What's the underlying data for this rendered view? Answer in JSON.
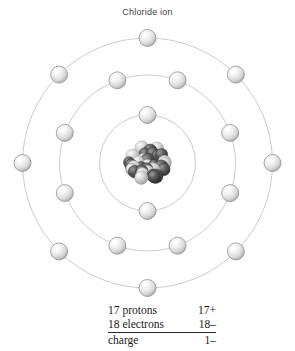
{
  "figure": {
    "title": "Chloride ion",
    "background_color": "#ffffff"
  },
  "atom": {
    "center": {
      "x": 147.5,
      "y": 141
    },
    "nucleus": {
      "name": "nucleus",
      "radius": 26,
      "light_color": "#c9c9c9",
      "dark_color": "#3f3f3f",
      "particle_count": 35
    },
    "shell_style": {
      "stroke_color": "#b4b4b4",
      "stroke_width": 0.7
    },
    "electron_style": {
      "radius": 8.5,
      "fill_color": "#e3e3e3",
      "highlight_color": "#ffffff",
      "edge_color": "#8e8e8e"
    },
    "shells": [
      {
        "name": "shell-1",
        "label": "K",
        "radius": 48,
        "electron_count": 2,
        "angles_deg": [
          270,
          90
        ]
      },
      {
        "name": "shell-2",
        "label": "L",
        "radius": 88,
        "electron_count": 8,
        "angles_deg": [
          250,
          290,
          200,
          340,
          160,
          20,
          110,
          70
        ]
      },
      {
        "name": "shell-3",
        "label": "M",
        "radius": 125,
        "electron_count": 8,
        "angles_deg": [
          270,
          225,
          315,
          180,
          0,
          135,
          45,
          90
        ]
      }
    ],
    "total_electrons": 18
  },
  "data_table": {
    "rows": [
      {
        "label": "17 protons",
        "value": "17+"
      },
      {
        "label": "18 electrons",
        "value": "18–"
      },
      {
        "label": "charge",
        "value": "1–"
      }
    ]
  },
  "chart_data": {
    "type": "diagram",
    "title": "Chloride ion",
    "subtype": "bohr-atomic-shell-model",
    "element": "Chlorine (chloride ion)",
    "protons": 17,
    "electrons": 18,
    "charge": "1-",
    "shell_occupancy": [
      2,
      8,
      8
    ],
    "shell_labels": [
      "K",
      "L",
      "M"
    ],
    "shell_radii_px": [
      48,
      88,
      125
    ],
    "annotations": [
      "17 protons",
      "17+",
      "18 electrons",
      "18–",
      "charge",
      "1–"
    ]
  }
}
